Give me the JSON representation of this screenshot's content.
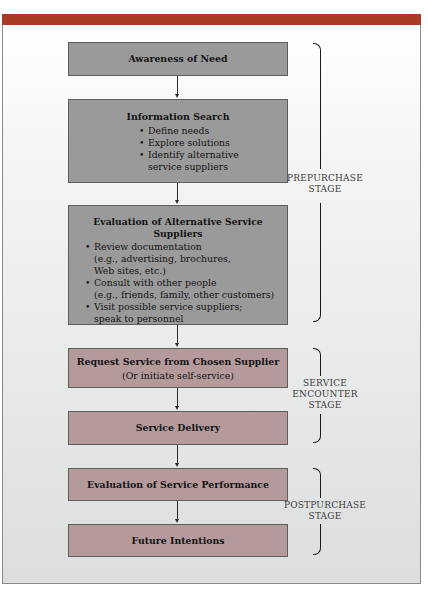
{
  "header": {
    "accent_color": "#a93a26"
  },
  "flow": {
    "awareness": {
      "title": "Awareness of Need"
    },
    "information_search": {
      "title": "Information Search",
      "bullets": [
        "Define needs",
        "Explore solutions",
        "Identify alternative service suppliers"
      ]
    },
    "evaluation_alternatives": {
      "title": "Evaluation of Alternative Service Suppliers",
      "bullets": [
        "Review documentation (e.g., advertising, brochures, Web sites, etc.)",
        "Consult with other people (e.g., friends, family, other customers)",
        "Visit possible service suppliers; speak to personnel"
      ],
      "bullet_lines": [
        [
          "Review documentation",
          "(e.g., advertising, brochures,",
          "Web sites, etc.)"
        ],
        [
          "Consult with other people",
          "(e.g., friends, family, other customers)"
        ],
        [
          "Visit possible service suppliers;",
          "speak to personnel"
        ]
      ]
    },
    "request_service": {
      "title": "Request Service from Chosen Supplier",
      "subtitle": "(Or initiate self-service)"
    },
    "service_delivery": {
      "title": "Service Delivery"
    },
    "evaluation_performance": {
      "title": "Evaluation of Service Performance"
    },
    "future_intentions": {
      "title": "Future Intentions"
    }
  },
  "stages": {
    "prepurchase": {
      "line1": "PREPURCHASE",
      "line2": "STAGE"
    },
    "service_encounter": {
      "line1": "SERVICE",
      "line2": "ENCOUNTER",
      "line3": "STAGE"
    },
    "postpurchase": {
      "line1": "POSTPURCHASE",
      "line2": "STAGE"
    }
  },
  "colors": {
    "prepurchase_box": "#9a9a9a",
    "encounter_postpurchase_box": "#b59a9c"
  }
}
